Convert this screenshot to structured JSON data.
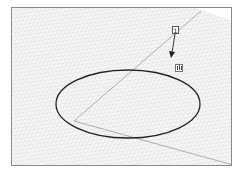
{
  "figure": {
    "type": "3d-viewport-sketch",
    "callout": {
      "label": "1"
    },
    "cursor_icon": {
      "name": "pushpull-tool-icon"
    },
    "shapes": [
      {
        "kind": "ellipse",
        "description": "circle drawn on ground plane",
        "stroke": "#222222"
      }
    ],
    "axes": [
      {
        "name": "green-axis",
        "color": "#9a9a9a"
      },
      {
        "name": "red-axis",
        "color": "#9a9a9a"
      }
    ],
    "grid": {
      "visible": true,
      "color": "#cfcfcf"
    }
  }
}
